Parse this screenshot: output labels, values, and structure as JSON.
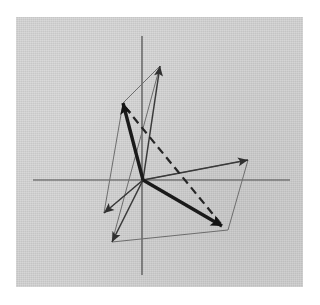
{
  "figure": {
    "background_color": "#ffffff",
    "panel_color": "#d2d2d2",
    "panel": {
      "x": 16,
      "y": 17,
      "width": 287,
      "height": 270
    }
  },
  "chart_data": {
    "type": "scatter",
    "xlabel": "",
    "ylabel": "",
    "grid": false,
    "legend": "none",
    "origin_px": {
      "x": 143,
      "y": 180
    },
    "axes": {
      "x_axis": {
        "x1": 33,
        "y1": 180,
        "x2": 290,
        "y2": 180,
        "color": "#4a4a4a"
      },
      "y_axis": {
        "x1": 142,
        "y1": 36,
        "x2": 142,
        "y2": 275,
        "color": "#4a4a4a"
      }
    },
    "vectors": [
      {
        "name": "v-up-left-thick",
        "style": "thick",
        "x1": 143,
        "y1": 180,
        "x2": 123,
        "y2": 103,
        "arrow": true,
        "color": "#1a1a1a"
      },
      {
        "name": "v-up-thin",
        "style": "thin",
        "x1": 143,
        "y1": 180,
        "x2": 160,
        "y2": 66,
        "arrow": true,
        "color": "#3a3a3a"
      },
      {
        "name": "v-right-thin",
        "style": "thin",
        "x1": 143,
        "y1": 180,
        "x2": 248,
        "y2": 160,
        "arrow": true,
        "color": "#3a3a3a"
      },
      {
        "name": "v-down-right-thick",
        "style": "thick",
        "x1": 143,
        "y1": 180,
        "x2": 222,
        "y2": 226,
        "arrow": true,
        "color": "#1a1a1a"
      },
      {
        "name": "v-down-left-thin",
        "style": "thin",
        "x1": 143,
        "y1": 180,
        "x2": 104,
        "y2": 213,
        "arrow": true,
        "color": "#3a3a3a"
      },
      {
        "name": "v-down-thin",
        "style": "thin",
        "x1": 143,
        "y1": 180,
        "x2": 112,
        "y2": 242,
        "arrow": true,
        "color": "#3a3a3a"
      },
      {
        "name": "v-resultant-dashed",
        "style": "dashed",
        "x1": 143,
        "y1": 180,
        "x2": 222,
        "y2": 226,
        "arrow": false,
        "color": "#262626",
        "note": "dashed diagonal drawn from upper-left tip to lower-right tip"
      }
    ],
    "dashed_segment": {
      "x1": 125,
      "y1": 107,
      "x2": 221,
      "y2": 224
    },
    "construction_edges": [
      {
        "name": "edge-upleft-to-uptip",
        "x1": 123,
        "y1": 103,
        "x2": 160,
        "y2": 66
      },
      {
        "name": "edge-uptip-to-downleft",
        "x1": 160,
        "y1": 66,
        "x2": 112,
        "y2": 242
      },
      {
        "name": "edge-upleft-to-downlefttip",
        "x1": 123,
        "y1": 103,
        "x2": 104,
        "y2": 213
      },
      {
        "name": "edge-downlefttip-to-origin-side",
        "x1": 104,
        "y1": 213,
        "x2": 143,
        "y2": 180
      },
      {
        "name": "edge-righttip-to-downrighttip",
        "x1": 248,
        "y1": 160,
        "x2": 228,
        "y2": 230
      },
      {
        "name": "edge-downtip-to-downrighttip",
        "x1": 112,
        "y1": 242,
        "x2": 228,
        "y2": 230
      },
      {
        "name": "edge-origin-to-righttip-thin",
        "x1": 143,
        "y1": 180,
        "x2": 248,
        "y2": 160
      }
    ],
    "arrowheads": [
      {
        "name": "arrowhead-up-left",
        "x": 123,
        "y": 103,
        "angle_deg": 255.4,
        "size": 11,
        "weight": "heavy"
      },
      {
        "name": "arrowhead-up",
        "x": 160,
        "y": 66,
        "angle_deg": 278.5,
        "size": 10,
        "weight": "normal"
      },
      {
        "name": "arrowhead-right",
        "x": 248,
        "y": 160,
        "angle_deg": 349.2,
        "size": 10,
        "weight": "normal"
      },
      {
        "name": "arrowhead-down-right",
        "x": 222,
        "y": 226,
        "angle_deg": 30.2,
        "size": 11,
        "weight": "heavy"
      },
      {
        "name": "arrowhead-down-left",
        "x": 104,
        "y": 213,
        "angle_deg": 139.8,
        "size": 10,
        "weight": "normal"
      },
      {
        "name": "arrowhead-down",
        "x": 112,
        "y": 242,
        "angle_deg": 116.5,
        "size": 10,
        "weight": "normal"
      }
    ]
  }
}
